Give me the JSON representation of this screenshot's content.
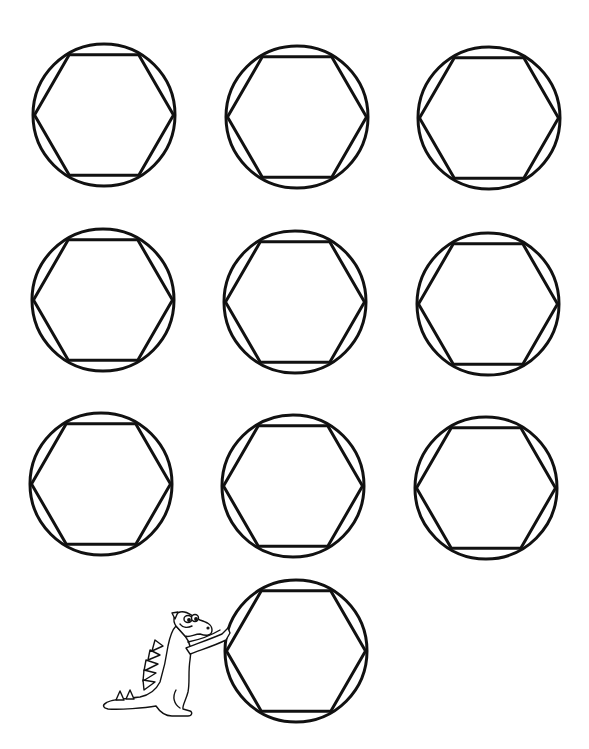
{
  "page": {
    "background": "#ffffff",
    "stroke_color": "#111111",
    "stroke_width": 3
  },
  "shapes": {
    "radius": 71,
    "items": [
      {
        "label": "circle-hexagon 1",
        "cx": 104,
        "cy": 115
      },
      {
        "label": "circle-hexagon 2",
        "cx": 297,
        "cy": 117
      },
      {
        "label": "circle-hexagon 3",
        "cx": 489,
        "cy": 118
      },
      {
        "label": "circle-hexagon 4",
        "cx": 103,
        "cy": 300
      },
      {
        "label": "circle-hexagon 5",
        "cx": 295,
        "cy": 302
      },
      {
        "label": "circle-hexagon 6",
        "cx": 488,
        "cy": 304
      },
      {
        "label": "circle-hexagon 7",
        "cx": 101,
        "cy": 484
      },
      {
        "label": "circle-hexagon 8",
        "cx": 293,
        "cy": 486
      },
      {
        "label": "circle-hexagon 9",
        "cx": 486,
        "cy": 488
      },
      {
        "label": "circle-hexagon 10",
        "cx": 296,
        "cy": 651
      }
    ]
  },
  "illustration": {
    "label": "Cartoon dinosaur pushing the last circle"
  }
}
